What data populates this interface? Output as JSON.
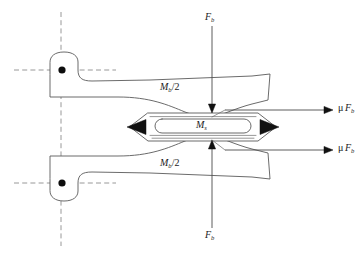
{
  "figure": {
    "name": "brake-caliper-free-body-diagram",
    "background_color": "#ffffff",
    "outline_color": "#5a5a5a",
    "centerline_color": "#8d8d8d",
    "solid_color": "#111111",
    "width": 364,
    "height": 256
  },
  "labels": {
    "force_top": {
      "symbol": "F",
      "subscript": "b",
      "text": "F_b"
    },
    "force_bottom": {
      "symbol": "F",
      "subscript": "b",
      "text": "F_b"
    },
    "moment_upper_arm": {
      "symbol": "M",
      "subscript": "b",
      "divisor": "/2",
      "text": "M_b/2"
    },
    "moment_lower_arm": {
      "symbol": "M",
      "subscript": "b",
      "divisor": "/2",
      "text": "M_b/2"
    },
    "moment_center": {
      "symbol": "M",
      "subscript": "s",
      "text": "M_s"
    },
    "friction_upper": {
      "mu": "μ",
      "symbol": "F",
      "subscript": "b",
      "text": "μ F_b"
    },
    "friction_lower": {
      "mu": "μ",
      "symbol": "F",
      "subscript": "b",
      "text": "μ F_b"
    }
  },
  "elements": {
    "upper_pivot": {
      "name": "upper-pivot-point",
      "cx": 62,
      "cy": 70
    },
    "lower_pivot": {
      "name": "lower-pivot-point",
      "cx": 62,
      "cy": 183
    },
    "vertical_centerline": {
      "x": 61,
      "y1": 12,
      "y2": 246
    },
    "upper_horizontal_centerline": {
      "y": 70,
      "x1": 14,
      "x2": 116
    },
    "lower_horizontal_centerline": {
      "y": 183,
      "x1": 14,
      "x2": 116
    },
    "center_pad_assembly": {
      "name": "friction-pad-stack",
      "cx": 200,
      "cy": 127
    },
    "left_arrowhead": {
      "name": "left-reaction-arrow",
      "direction": "left"
    },
    "right_arrowhead": {
      "name": "right-reaction-arrow",
      "direction": "right"
    }
  }
}
